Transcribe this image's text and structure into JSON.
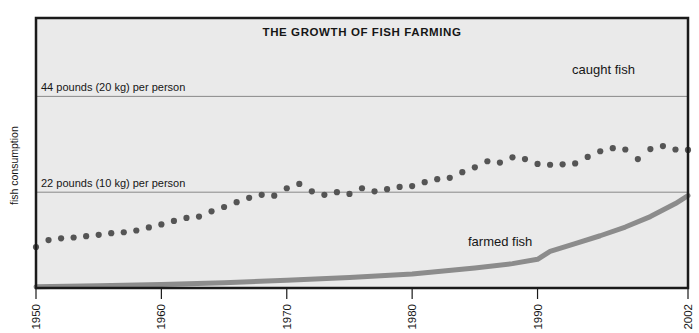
{
  "chart_data": {
    "type": "scatter",
    "title": "THE GROWTH OF FISH FARMING",
    "xlabel": "",
    "ylabel": "fish consumption",
    "xlim": [
      1950,
      2002
    ],
    "ylim": [
      0,
      62
    ],
    "grid": true,
    "legend_position": "inline-annotations",
    "xticks": [
      "1950",
      "1960",
      "1970",
      "1980",
      "1990",
      "2002"
    ],
    "xtick_values": [
      1950,
      1960,
      1970,
      1980,
      1990,
      2002
    ],
    "gridlines": [
      {
        "value": 44,
        "label": "44 pounds (20 kg) per person"
      },
      {
        "value": 22,
        "label": "22 pounds (10 kg) per person"
      }
    ],
    "series": [
      {
        "name": "caught fish",
        "style": "dotted-markers",
        "color": "#555555",
        "annotation": "caught fish",
        "x": [
          1950,
          1951,
          1952,
          1953,
          1954,
          1955,
          1956,
          1957,
          1958,
          1959,
          1960,
          1961,
          1962,
          1963,
          1964,
          1965,
          1966,
          1967,
          1968,
          1969,
          1970,
          1971,
          1972,
          1973,
          1974,
          1975,
          1976,
          1977,
          1978,
          1979,
          1980,
          1981,
          1982,
          1983,
          1984,
          1985,
          1986,
          1987,
          1988,
          1989,
          1990,
          1991,
          1992,
          1993,
          1994,
          1995,
          1996,
          1997,
          1998,
          1999,
          2000,
          2001,
          2002
        ],
        "values": [
          9.4,
          11.0,
          11.4,
          11.6,
          11.9,
          12.2,
          12.6,
          12.8,
          13.2,
          13.9,
          14.6,
          15.4,
          16.1,
          16.4,
          17.6,
          18.6,
          19.7,
          20.7,
          21.4,
          21.2,
          22.9,
          23.9,
          22.2,
          21.4,
          22.0,
          21.6,
          22.9,
          22.2,
          22.7,
          23.2,
          23.4,
          24.3,
          25.0,
          25.3,
          26.6,
          27.7,
          29.1,
          28.8,
          30.0,
          29.6,
          28.5,
          28.3,
          28.4,
          28.6,
          30.1,
          31.4,
          32.1,
          31.8,
          29.6,
          31.9,
          32.6,
          31.8,
          31.7
        ]
      },
      {
        "name": "farmed fish",
        "style": "thick-line",
        "color": "#8c8c8c",
        "annotation": "farmed fish",
        "x": [
          1950,
          1955,
          1960,
          1965,
          1970,
          1975,
          1980,
          1985,
          1988,
          1990,
          1991,
          1993,
          1995,
          1997,
          1999,
          2001,
          2002
        ],
        "values": [
          0.3,
          0.5,
          0.8,
          1.2,
          1.8,
          2.4,
          3.2,
          4.6,
          5.6,
          6.6,
          8.4,
          10.2,
          12.0,
          14.0,
          16.4,
          19.4,
          21.2
        ]
      }
    ]
  },
  "annotations": {
    "caught_fish_label": "caught fish",
    "farmed_fish_label": "farmed fish"
  },
  "colors": {
    "plot_background": "#eaeaea",
    "frame": "#1a1a1a",
    "gridline": "#888888",
    "caught_fish": "#555555",
    "farmed_fish": "#8c8c8c",
    "text": "#161616"
  }
}
